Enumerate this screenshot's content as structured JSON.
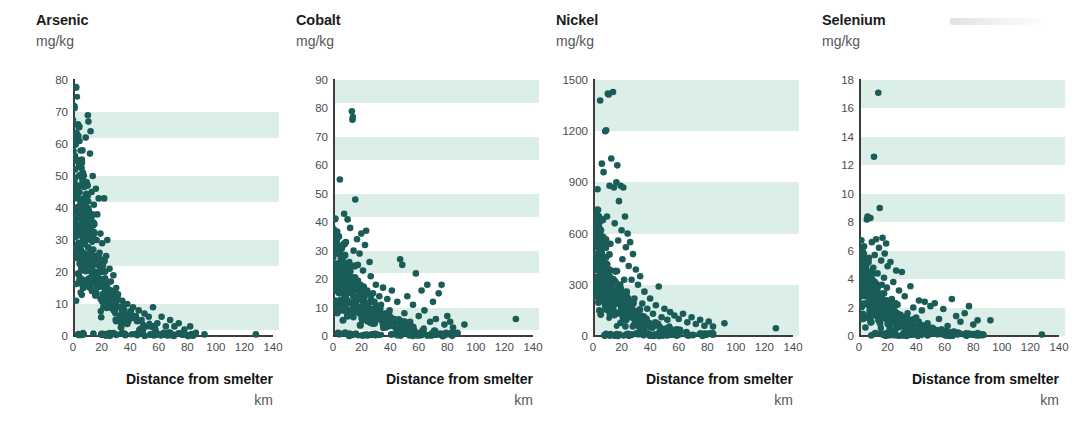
{
  "figure": {
    "background": "#ffffff",
    "dot_color": "#1a5c57",
    "band_color": "#dbeee8",
    "axis_color": "#3d3d3d",
    "artifact_label": "scan-artifact"
  },
  "shared": {
    "xlabel": "Distance from smelter",
    "xunit": "km",
    "unit": "mg/kg",
    "xticks": [
      0,
      20,
      40,
      60,
      80,
      100,
      120,
      140
    ],
    "xlim": [
      0,
      140
    ]
  },
  "chart_data": [
    {
      "type": "scatter",
      "title": "Arsenic",
      "ylabel": "mg/kg",
      "xlabel": "Distance from smelter",
      "xunit": "km",
      "xlim": [
        0,
        140
      ],
      "ylim": [
        0,
        80
      ],
      "xticks": [
        0,
        20,
        40,
        60,
        80,
        100,
        120,
        140
      ],
      "yticks": [
        0,
        10,
        20,
        30,
        40,
        50,
        60,
        70,
        80
      ],
      "grid": false,
      "bands": [
        [
          2,
          10
        ],
        [
          22,
          30
        ],
        [
          42,
          50
        ],
        [
          62,
          70
        ]
      ],
      "legend": "none",
      "n_points": 300,
      "seed": 11,
      "decay_km": 17,
      "y_peak": 72,
      "y_floor": 0,
      "points": [
        [
          1.5,
          52
        ],
        [
          1.6,
          49.5
        ],
        [
          2.0,
          31
        ],
        [
          2.2,
          11
        ],
        [
          2.5,
          28
        ],
        [
          3.0,
          44
        ],
        [
          3.4,
          25
        ],
        [
          3.8,
          37
        ],
        [
          4.1,
          19
        ],
        [
          4.4,
          55
        ],
        [
          4.8,
          40
        ],
        [
          5.2,
          29
        ],
        [
          5.5,
          47
        ],
        [
          5.9,
          22
        ],
        [
          6.2,
          34
        ],
        [
          6.6,
          58
        ],
        [
          7.0,
          51
        ],
        [
          7.4,
          26
        ],
        [
          7.8,
          43
        ],
        [
          8.1,
          17
        ],
        [
          8.5,
          36
        ],
        [
          8.9,
          62
        ],
        [
          9.2,
          30
        ],
        [
          9.6,
          48
        ],
        [
          10.0,
          21
        ],
        [
          10.4,
          69
        ],
        [
          10.8,
          67
        ],
        [
          11.1,
          39
        ],
        [
          11.5,
          24
        ],
        [
          11.9,
          57
        ],
        [
          12.3,
          64
        ],
        [
          12.7,
          33
        ],
        [
          13.0,
          45
        ],
        [
          13.4,
          18
        ],
        [
          13.8,
          50
        ],
        [
          14.2,
          27
        ],
        [
          14.6,
          41
        ],
        [
          15.0,
          35
        ],
        [
          15.5,
          23
        ],
        [
          16.0,
          46
        ],
        [
          16.5,
          30
        ],
        [
          17.0,
          38
        ],
        [
          17.5,
          20
        ],
        [
          18.0,
          43
        ],
        [
          18.6,
          26
        ],
        [
          19.2,
          32
        ],
        [
          19.8,
          16
        ],
        [
          20.4,
          29
        ],
        [
          21.0,
          22
        ],
        [
          21.8,
          43
        ],
        [
          22.5,
          18
        ],
        [
          23.2,
          25
        ],
        [
          24.0,
          30
        ],
        [
          24.8,
          14
        ],
        [
          25.6,
          21
        ],
        [
          26.5,
          17
        ],
        [
          27.4,
          12
        ],
        [
          28.3,
          19
        ],
        [
          29.2,
          10
        ],
        [
          30.2,
          15
        ],
        [
          31.5,
          13
        ],
        [
          33.0,
          9
        ],
        [
          34.5,
          11
        ],
        [
          36.0,
          8
        ],
        [
          38.0,
          10
        ],
        [
          40.0,
          7
        ],
        [
          42.0,
          9
        ],
        [
          44.0,
          6
        ],
        [
          46.0,
          8
        ],
        [
          48.0,
          5
        ],
        [
          50.0,
          7
        ],
        [
          53.0,
          6
        ],
        [
          56.0,
          9
        ],
        [
          59.0,
          4
        ],
        [
          62.0,
          6
        ],
        [
          65.0,
          3
        ],
        [
          68.0,
          5
        ],
        [
          71.0,
          3
        ],
        [
          74.0,
          4
        ],
        [
          78.0,
          2
        ],
        [
          82.0,
          3
        ],
        [
          86.0,
          1
        ],
        [
          92.0,
          0.5
        ],
        [
          128.0,
          0.5
        ]
      ]
    },
    {
      "type": "scatter",
      "title": "Cobalt",
      "ylabel": "mg/kg",
      "xlabel": "Distance from smelter",
      "xunit": "km",
      "xlim": [
        0,
        140
      ],
      "ylim": [
        0,
        90
      ],
      "xticks": [
        0,
        20,
        40,
        60,
        80,
        100,
        120,
        140
      ],
      "yticks": [
        0,
        10,
        20,
        30,
        40,
        50,
        60,
        70,
        80,
        90
      ],
      "grid": false,
      "bands": [
        [
          2,
          10
        ],
        [
          22,
          30
        ],
        [
          42,
          50
        ],
        [
          62,
          70
        ],
        [
          82,
          90
        ]
      ],
      "legend": "none",
      "n_points": 300,
      "seed": 23,
      "decay_km": 24,
      "y_peak": 36,
      "y_floor": 0,
      "points": [
        [
          1.2,
          19
        ],
        [
          1.8,
          12
        ],
        [
          2.4,
          24
        ],
        [
          3.0,
          8
        ],
        [
          3.6,
          31
        ],
        [
          4.2,
          15
        ],
        [
          4.8,
          55
        ],
        [
          5.4,
          21
        ],
        [
          6.0,
          10
        ],
        [
          6.6,
          28
        ],
        [
          7.2,
          17
        ],
        [
          7.8,
          43
        ],
        [
          8.4,
          13
        ],
        [
          9.0,
          33
        ],
        [
          9.6,
          22
        ],
        [
          10.2,
          41
        ],
        [
          10.8,
          9
        ],
        [
          11.4,
          26
        ],
        [
          12.0,
          38
        ],
        [
          12.6,
          16
        ],
        [
          13.2,
          79
        ],
        [
          13.6,
          76
        ],
        [
          13.9,
          77
        ],
        [
          14.4,
          30
        ],
        [
          15.0,
          20
        ],
        [
          15.6,
          48
        ],
        [
          16.2,
          11
        ],
        [
          16.8,
          34
        ],
        [
          17.4,
          25
        ],
        [
          18.0,
          14
        ],
        [
          18.6,
          29
        ],
        [
          19.2,
          18
        ],
        [
          19.8,
          36
        ],
        [
          20.4,
          7
        ],
        [
          21.0,
          23
        ],
        [
          21.6,
          13
        ],
        [
          22.4,
          32
        ],
        [
          23.2,
          37
        ],
        [
          24.0,
          16
        ],
        [
          24.8,
          10
        ],
        [
          25.6,
          26
        ],
        [
          26.4,
          21
        ],
        [
          27.2,
          9
        ],
        [
          28.0,
          15
        ],
        [
          29.0,
          12
        ],
        [
          30.0,
          18
        ],
        [
          31.2,
          8
        ],
        [
          32.4,
          14
        ],
        [
          33.6,
          11
        ],
        [
          35.0,
          17
        ],
        [
          36.4,
          7
        ],
        [
          38.0,
          13
        ],
        [
          39.6,
          9
        ],
        [
          41.2,
          16
        ],
        [
          43.0,
          6
        ],
        [
          45.0,
          12
        ],
        [
          47.0,
          27
        ],
        [
          48.5,
          25
        ],
        [
          50.0,
          8
        ],
        [
          52.0,
          14
        ],
        [
          54.0,
          5
        ],
        [
          56.0,
          11
        ],
        [
          58.0,
          22
        ],
        [
          60.0,
          7
        ],
        [
          62.0,
          16
        ],
        [
          64.0,
          9
        ],
        [
          66.0,
          18
        ],
        [
          68.0,
          5
        ],
        [
          70.0,
          12
        ],
        [
          72.0,
          6
        ],
        [
          74.0,
          15
        ],
        [
          76.0,
          18
        ],
        [
          78.0,
          4
        ],
        [
          80.0,
          7
        ],
        [
          82.0,
          5
        ],
        [
          84.0,
          3
        ],
        [
          92.0,
          4
        ],
        [
          128.0,
          6
        ]
      ]
    },
    {
      "type": "scatter",
      "title": "Nickel",
      "ylabel": "mg/kg",
      "xlabel": "Distance from smelter",
      "xunit": "km",
      "xlim": [
        0,
        140
      ],
      "ylim": [
        0,
        1500
      ],
      "xticks": [
        0,
        20,
        40,
        60,
        80,
        100,
        120,
        140
      ],
      "yticks": [
        0,
        300,
        600,
        900,
        1200,
        1500
      ],
      "grid": false,
      "bands": [
        [
          0,
          300
        ],
        [
          600,
          900
        ],
        [
          1200,
          1500
        ]
      ],
      "legend": "none",
      "n_points": 320,
      "seed": 37,
      "decay_km": 19,
      "y_peak": 760,
      "y_floor": 0,
      "points": [
        [
          1.5,
          480
        ],
        [
          2.0,
          580
        ],
        [
          2.6,
          250
        ],
        [
          3.2,
          860
        ],
        [
          3.8,
          330
        ],
        [
          4.4,
          150
        ],
        [
          5.0,
          1380
        ],
        [
          5.6,
          620
        ],
        [
          6.2,
          1010
        ],
        [
          6.8,
          430
        ],
        [
          7.4,
          960
        ],
        [
          8.0,
          200
        ],
        [
          8.6,
          1200
        ],
        [
          9.2,
          1205
        ],
        [
          9.8,
          700
        ],
        [
          10.4,
          1420
        ],
        [
          11.0,
          1415
        ],
        [
          11.6,
          880
        ],
        [
          12.2,
          540
        ],
        [
          12.8,
          1040
        ],
        [
          13.4,
          300
        ],
        [
          14.0,
          1430
        ],
        [
          14.6,
          870
        ],
        [
          15.2,
          660
        ],
        [
          15.8,
          380
        ],
        [
          16.4,
          900
        ],
        [
          17.0,
          1000
        ],
        [
          17.6,
          560
        ],
        [
          18.2,
          790
        ],
        [
          18.8,
          240
        ],
        [
          19.4,
          880
        ],
        [
          20.0,
          620
        ],
        [
          20.6,
          450
        ],
        [
          21.2,
          870
        ],
        [
          21.8,
          330
        ],
        [
          22.4,
          700
        ],
        [
          23.0,
          520
        ],
        [
          23.6,
          260
        ],
        [
          24.2,
          600
        ],
        [
          25.0,
          410
        ],
        [
          26.0,
          550
        ],
        [
          27.0,
          330
        ],
        [
          28.0,
          480
        ],
        [
          29.0,
          220
        ],
        [
          30.0,
          390
        ],
        [
          31.5,
          300
        ],
        [
          33.0,
          350
        ],
        [
          34.5,
          190
        ],
        [
          36.0,
          260
        ],
        [
          38.0,
          160
        ],
        [
          40.0,
          220
        ],
        [
          42.0,
          130
        ],
        [
          44.0,
          180
        ],
        [
          46.0,
          290
        ],
        [
          48.0,
          110
        ],
        [
          50.0,
          160
        ],
        [
          52.0,
          95
        ],
        [
          54.0,
          140
        ],
        [
          57.0,
          120
        ],
        [
          60.0,
          100
        ],
        [
          63.0,
          130
        ],
        [
          66.0,
          80
        ],
        [
          69.0,
          110
        ],
        [
          72.0,
          70
        ],
        [
          75.0,
          95
        ],
        [
          78.0,
          60
        ],
        [
          81.0,
          85
        ],
        [
          84.0,
          55
        ],
        [
          92.0,
          75
        ],
        [
          128.0,
          45
        ]
      ]
    },
    {
      "type": "scatter",
      "title": "Selenium",
      "ylabel": "mg/kg",
      "xlabel": "Distance from smelter",
      "xunit": "km",
      "xlim": [
        0,
        140
      ],
      "ylim": [
        0,
        18
      ],
      "xticks": [
        0,
        20,
        40,
        60,
        80,
        100,
        120,
        140
      ],
      "yticks": [
        0,
        2,
        4,
        6,
        8,
        10,
        12,
        14,
        16,
        18
      ],
      "grid": false,
      "bands": [
        [
          0,
          2
        ],
        [
          4,
          6
        ],
        [
          8,
          10
        ],
        [
          12,
          14
        ],
        [
          16,
          18
        ]
      ],
      "legend": "none",
      "n_points": 300,
      "seed": 53,
      "decay_km": 21,
      "y_peak": 6.4,
      "y_floor": 0,
      "points": [
        [
          1.0,
          4.6
        ],
        [
          1.5,
          6.0
        ],
        [
          2.0,
          2.2
        ],
        [
          2.5,
          5.1
        ],
        [
          3.0,
          1.2
        ],
        [
          3.5,
          6.3
        ],
        [
          4.0,
          3.3
        ],
        [
          4.5,
          0.6
        ],
        [
          5.0,
          4.2
        ],
        [
          5.5,
          8.2
        ],
        [
          6.0,
          8.4
        ],
        [
          6.5,
          2.7
        ],
        [
          7.0,
          5.5
        ],
        [
          7.5,
          1.8
        ],
        [
          8.0,
          8.3
        ],
        [
          8.5,
          3.9
        ],
        [
          9.0,
          6.6
        ],
        [
          9.5,
          2.1
        ],
        [
          10.0,
          4.8
        ],
        [
          10.5,
          12.6
        ],
        [
          11.0,
          5.7
        ],
        [
          11.5,
          3.1
        ],
        [
          12.0,
          6.8
        ],
        [
          12.5,
          1.5
        ],
        [
          13.0,
          4.4
        ],
        [
          13.5,
          17.1
        ],
        [
          14.0,
          6.2
        ],
        [
          14.5,
          9.0
        ],
        [
          15.0,
          2.9
        ],
        [
          15.5,
          5.3
        ],
        [
          16.0,
          3.6
        ],
        [
          16.5,
          6.9
        ],
        [
          17.0,
          1.9
        ],
        [
          17.5,
          4.1
        ],
        [
          18.0,
          5.8
        ],
        [
          18.5,
          2.4
        ],
        [
          19.0,
          6.5
        ],
        [
          19.5,
          3.4
        ],
        [
          20.0,
          4.9
        ],
        [
          21.0,
          1.7
        ],
        [
          22.0,
          5.2
        ],
        [
          23.0,
          2.6
        ],
        [
          24.0,
          3.8
        ],
        [
          25.0,
          1.4
        ],
        [
          26.0,
          4.6
        ],
        [
          27.0,
          2.2
        ],
        [
          28.0,
          3.2
        ],
        [
          29.0,
          1.1
        ],
        [
          30.0,
          4.5
        ],
        [
          32.0,
          2.8
        ],
        [
          34.0,
          1.6
        ],
        [
          36.0,
          3.5
        ],
        [
          38.0,
          2.0
        ],
        [
          40.0,
          1.3
        ],
        [
          42.0,
          2.5
        ],
        [
          44.0,
          1.8
        ],
        [
          46.0,
          2.4
        ],
        [
          48.0,
          0.9
        ],
        [
          50.0,
          2.1
        ],
        [
          53.0,
          2.3
        ],
        [
          56.0,
          1.2
        ],
        [
          59.0,
          1.9
        ],
        [
          62.0,
          0.7
        ],
        [
          65.0,
          2.6
        ],
        [
          68.0,
          1.4
        ],
        [
          71.0,
          1.0
        ],
        [
          74.0,
          1.6
        ],
        [
          77.0,
          2.1
        ],
        [
          80.0,
          0.8
        ],
        [
          83.0,
          1.1
        ],
        [
          92.0,
          1.1
        ],
        [
          128.0,
          0.1
        ]
      ]
    }
  ]
}
